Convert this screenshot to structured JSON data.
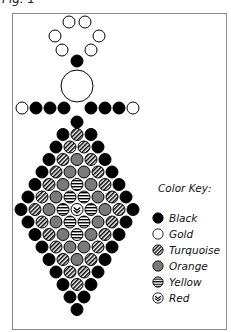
{
  "figure": {
    "title": "Fig. 1"
  },
  "colors": {
    "Black": "#000000",
    "Gold": "#ffffff",
    "Turquoise": "hatch-diagonal",
    "Orange": "#7a7a7a",
    "Yellow": "hatch-horizontal",
    "Red": "chevron"
  },
  "legend": {
    "title": "Color Key:",
    "items": [
      {
        "key": "B",
        "label": "Black"
      },
      {
        "key": "G",
        "label": "Gold"
      },
      {
        "key": "T",
        "label": "Turquoise"
      },
      {
        "key": "O",
        "label": "Orange"
      },
      {
        "key": "Y",
        "label": "Yellow"
      },
      {
        "key": "R",
        "label": "Red"
      }
    ]
  },
  "pattern": {
    "bead_radius": 6,
    "h_spacing": 14,
    "center_x": 77,
    "top_beads": [
      {
        "x": 69,
        "y": 22,
        "c": "G"
      },
      {
        "x": 85,
        "y": 22,
        "c": "G"
      },
      {
        "x": 55,
        "y": 36,
        "c": "G"
      },
      {
        "x": 99,
        "y": 36,
        "c": "G"
      },
      {
        "x": 62,
        "y": 50,
        "c": "G"
      },
      {
        "x": 91,
        "y": 50,
        "c": "G"
      },
      {
        "x": 77,
        "y": 61,
        "c": "B"
      }
    ],
    "center_bead": {
      "x": 77,
      "y": 86,
      "r": 16,
      "c": "G"
    },
    "arm_row": {
      "y": 108,
      "beads": [
        {
          "x": 22,
          "c": "G"
        },
        {
          "x": 36,
          "c": "B"
        },
        {
          "x": 50,
          "c": "B"
        },
        {
          "x": 64,
          "c": "B"
        },
        {
          "x": 91,
          "c": "B"
        },
        {
          "x": 105,
          "c": "B"
        },
        {
          "x": 119,
          "c": "B"
        },
        {
          "x": 133,
          "c": "G"
        }
      ]
    },
    "diamond_start_y": 122,
    "diamond_row_spacing": 12.5,
    "diamond_rows": [
      "B",
      "BTB",
      "BTTB",
      "BTOTB",
      "BTOOTB",
      "BTOYOTB",
      "BTOYYOTB",
      "BTOYRYOTB",
      "BTOYYOTB",
      "BTOYOTB",
      "BTOOTB",
      "BTOTB",
      "BTTB",
      "BTB",
      "BB",
      "B"
    ]
  }
}
